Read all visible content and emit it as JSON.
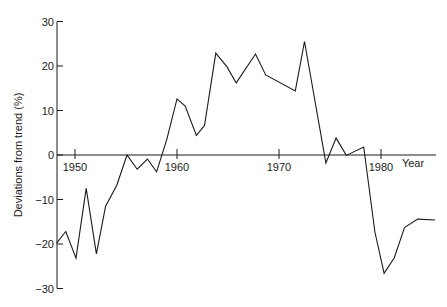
{
  "chart_data": {
    "type": "line",
    "title": "",
    "xlabel": "Year",
    "ylabel": "Deviations from trend (%)",
    "xlim": [
      1948.2,
      1985.3
    ],
    "ylim": [
      -30,
      30
    ],
    "grid": false,
    "legend": null,
    "x_ticks": [
      1950,
      1960,
      1970,
      1980
    ],
    "y_ticks": [
      30,
      20,
      10,
      0,
      -10,
      -20,
      -30
    ],
    "series": [
      {
        "name": "Deviations from trend",
        "x": [
          1948.2,
          1949.1,
          1950.1,
          1951.1,
          1952.1,
          1953.0,
          1954.1,
          1955.1,
          1956.1,
          1957.1,
          1958.0,
          1959.0,
          1960.0,
          1960.8,
          1961.9,
          1962.7,
          1963.8,
          1964.9,
          1965.8,
          1967.7,
          1968.7,
          1971.6,
          1972.5,
          1974.6,
          1975.6,
          1976.6,
          1978.3,
          1979.4,
          1980.3,
          1981.3,
          1982.3,
          1983.6,
          1985.3
        ],
        "values": [
          -19.8,
          -17.2,
          -23.2,
          -7.5,
          -22.2,
          -11.5,
          -6.8,
          0,
          -3.2,
          -0.9,
          -3.8,
          3.5,
          12.6,
          11.0,
          4.4,
          6.6,
          22.9,
          19.8,
          16.2,
          22.7,
          18.0,
          14.4,
          25.5,
          -1.8,
          3.8,
          -0.1,
          1.8,
          -17.3,
          -26.6,
          -23.1,
          -16.3,
          -14.4,
          -14.6
        ]
      }
    ]
  },
  "axes": {
    "x_title": "Year",
    "y_title": "Deviations from trend (%)"
  }
}
